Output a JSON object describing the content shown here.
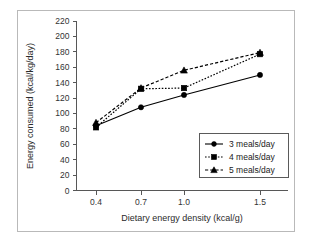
{
  "chart_data": {
    "type": "line",
    "title": "",
    "xlabel": "Dietary energy density (kcal/g)",
    "ylabel": "Energy consumed (kcal/kg/day)",
    "categories": [
      "0.4",
      "0.7",
      "1.0",
      "1.5"
    ],
    "xtick_labels": [
      "0.4",
      "0.7",
      "1.0",
      "1.5"
    ],
    "ytick_labels": [
      "0",
      "20",
      "40",
      "60",
      "80",
      "100",
      "120",
      "140",
      "160",
      "180",
      "200",
      "220"
    ],
    "ytick_values": [
      0,
      20,
      40,
      60,
      80,
      100,
      120,
      140,
      160,
      180,
      200,
      220
    ],
    "ylim": [
      0,
      220
    ],
    "grid": false,
    "legend_position": "lower-right",
    "series": [
      {
        "name": "3 meals/day",
        "label": "3 meals/day",
        "marker": "circle",
        "linestyle": "solid",
        "color": "#000000",
        "values": [
          84,
          108,
          124,
          150
        ]
      },
      {
        "name": "4 meals/day",
        "label": "4 meals/day",
        "marker": "square",
        "linestyle": "dotted",
        "color": "#000000",
        "values": [
          82,
          132,
          133,
          177
        ]
      },
      {
        "name": "5 meals/day",
        "label": "5 meals/day",
        "marker": "triangle",
        "linestyle": "dashed",
        "color": "#000000",
        "values": [
          88,
          133,
          156,
          179
        ]
      }
    ]
  },
  "axes": {
    "x_title": "Dietary energy density (kcal/g)",
    "y_title": "Energy consumed (kcal/kg/day)"
  }
}
